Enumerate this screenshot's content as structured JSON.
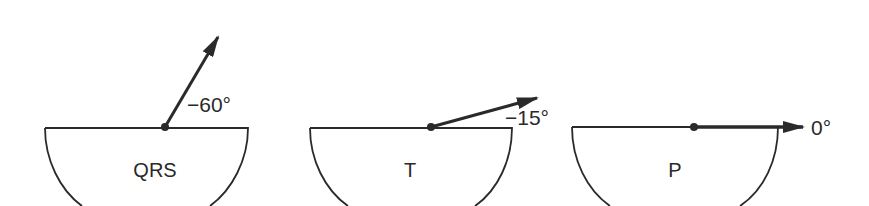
{
  "diagram": {
    "panels": [
      {
        "name": "QRS",
        "label": "QRS",
        "angle_label": "−60°",
        "angle_deg": -60
      },
      {
        "name": "T",
        "label": "T",
        "angle_label": "−15°",
        "angle_deg": -15
      },
      {
        "name": "P",
        "label": "P",
        "angle_label": "0°",
        "angle_deg": 0
      }
    ],
    "colors": {
      "stroke": "#2a2a2a",
      "background": "#ffffff"
    }
  }
}
